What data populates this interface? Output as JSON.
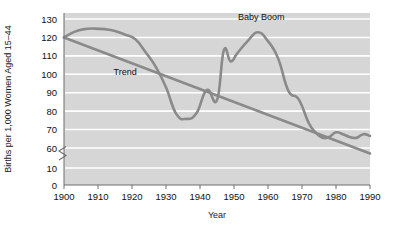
{
  "chart_data": {
    "type": "line",
    "title": "",
    "xlabel": "Year",
    "ylabel": "Births per 1,000 Women Aged 15–44",
    "xlim": [
      1900,
      1990
    ],
    "ylim": [
      0,
      130
    ],
    "y_axis_break": {
      "from": 10,
      "to": 60,
      "symbol": "zigzag"
    },
    "grid": "horizontal-white",
    "legend": "none",
    "xticks": [
      1900,
      1910,
      1920,
      1930,
      1940,
      1950,
      1960,
      1970,
      1980,
      1990
    ],
    "xtick_labels": [
      "1900",
      "1910",
      "1920",
      "1930",
      "1940",
      "1950",
      "1960",
      "1970",
      "1980",
      "1990"
    ],
    "yticks": [
      0,
      10,
      60,
      70,
      80,
      90,
      100,
      110,
      120,
      130
    ],
    "ytick_labels": [
      "0",
      "10",
      "60",
      "70",
      "80",
      "90",
      "100",
      "110",
      "120",
      "130"
    ],
    "annotations": [
      {
        "text": "Baby Boom",
        "x": 1958,
        "y": 131
      },
      {
        "text": "Trend",
        "x": 1918,
        "y": 101
      }
    ],
    "series": [
      {
        "name": "Birth rate",
        "x": [
          1900,
          1903,
          1906,
          1909,
          1912,
          1915,
          1918,
          1921,
          1924,
          1927,
          1930,
          1933,
          1936,
          1939,
          1942,
          1945,
          1947,
          1949,
          1951,
          1954,
          1957,
          1960,
          1963,
          1966,
          1969,
          1972,
          1974,
          1976,
          1978,
          1980,
          1982,
          1984,
          1986,
          1988,
          1990
        ],
        "values": [
          120.0,
          123.0,
          124.5,
          124.8,
          124.5,
          123.5,
          121.5,
          119.0,
          112.0,
          104.0,
          93.0,
          78.5,
          75.8,
          79.0,
          91.5,
          86.0,
          113.0,
          107.0,
          111.5,
          118.0,
          122.8,
          118.0,
          108.5,
          91.0,
          86.5,
          73.5,
          68.5,
          65.5,
          66.0,
          68.5,
          67.5,
          66.0,
          65.5,
          67.5,
          66.5
        ]
      },
      {
        "name": "Trend",
        "x": [
          1900,
          1990
        ],
        "values": [
          120.0,
          57.0
        ]
      }
    ]
  },
  "axes": {
    "y_title": "Births per 1,000 Women Aged 15–44",
    "x_title": "Year"
  }
}
